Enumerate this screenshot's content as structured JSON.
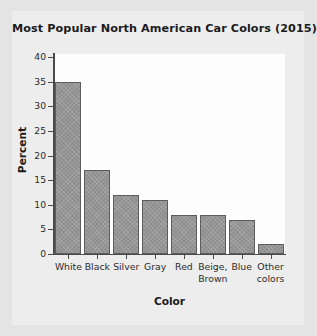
{
  "chart_data": {
    "type": "bar",
    "title": "Most Popular North American Car Colors (2015)",
    "xlabel": "Color",
    "ylabel": "Percent",
    "categories": [
      "White",
      "Black",
      "Silver",
      "Gray",
      "Red",
      "Beige, Brown",
      "Blue",
      "Other colors"
    ],
    "values": [
      35,
      17,
      12,
      11,
      8,
      8,
      7,
      2
    ],
    "ylim": [
      0,
      40
    ],
    "yticks": [
      0,
      5,
      10,
      15,
      20,
      25,
      30,
      35,
      40
    ],
    "ytick_labels": [
      "0",
      "5",
      "10",
      "15",
      "20",
      "25",
      "30",
      "35",
      "40"
    ],
    "grid": false,
    "legend": null,
    "bar_color": "#8e8e8e",
    "bar_edge_color": "#5d5d5d",
    "plot_background": "#fdfdfd",
    "figure_background": "#e4e4e4",
    "axis_color": "#4a4a4a",
    "category_labels_wrapped": [
      [
        "White"
      ],
      [
        "Black"
      ],
      [
        "Silver"
      ],
      [
        "Gray"
      ],
      [
        "Red"
      ],
      [
        "Beige,",
        "Brown"
      ],
      [
        "Blue"
      ],
      [
        "Other",
        "colors"
      ]
    ]
  }
}
